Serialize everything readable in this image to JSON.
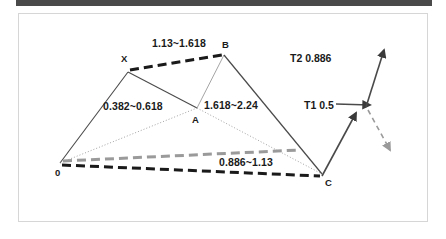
{
  "page": {
    "background": "#ffffff",
    "top_bar_color": "#4a4a4a",
    "panel_border_color": "#d6d6d6"
  },
  "diagram": {
    "type": "harmonic-price-pattern",
    "stroke_dark": "#3a3a3a",
    "stroke_black": "#1a1a1a",
    "stroke_gray": "#9a9a9a",
    "points": [
      {
        "id": "O",
        "label": "0",
        "x": 60,
        "y": 163,
        "label_x": 55,
        "label_y": 168
      },
      {
        "id": "X",
        "label": "X",
        "x": 128,
        "y": 72,
        "label_x": 121,
        "label_y": 54
      },
      {
        "id": "A",
        "label": "A",
        "x": 197,
        "y": 108,
        "label_x": 192,
        "label_y": 115
      },
      {
        "id": "B",
        "label": "B",
        "x": 224,
        "y": 55,
        "label_x": 222,
        "label_y": 40
      },
      {
        "id": "C",
        "label": "C",
        "x": 322,
        "y": 174,
        "label_x": 325,
        "label_y": 178
      }
    ],
    "ratios": [
      {
        "id": "xb-ratio",
        "text": "1.13~1.618",
        "x": 152,
        "y": 38
      },
      {
        "id": "ox-ratio",
        "text": "0.382~0.618",
        "x": 103,
        "y": 101
      },
      {
        "id": "ab-ratio",
        "text": "1.618~2.24",
        "x": 204,
        "y": 100
      },
      {
        "id": "oc-ratio",
        "text": "0.886~1.13",
        "x": 219,
        "y": 157
      }
    ],
    "targets": [
      {
        "id": "t2",
        "text": "T2 0.886",
        "x": 290,
        "y": 53
      },
      {
        "id": "t1",
        "text": "T1 0.5",
        "x": 304,
        "y": 100
      }
    ]
  }
}
